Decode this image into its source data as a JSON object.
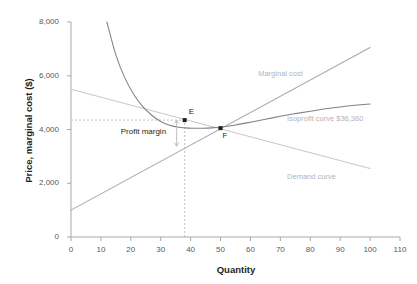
{
  "chart_data": {
    "type": "line",
    "title": "",
    "xlabel": "Quantity",
    "ylabel": "Price, marginal cost ($)",
    "xlim": [
      0,
      110
    ],
    "ylim": [
      0,
      8000
    ],
    "xticks": [
      "0",
      "10",
      "20",
      "30",
      "40",
      "50",
      "60",
      "70",
      "80",
      "90",
      "100",
      "110"
    ],
    "xtick_values": [
      0,
      10,
      20,
      30,
      40,
      50,
      60,
      70,
      80,
      90,
      100,
      110
    ],
    "yticks": [
      "0",
      "2,000",
      "4,000",
      "6,000",
      "8,000"
    ],
    "ytick_values": [
      0,
      2000,
      4000,
      6000,
      8000
    ],
    "grid": false,
    "legend_position": "inline-right",
    "series": [
      {
        "name": "Demand curve",
        "label": "Demand curve",
        "color": "#c9c9cb",
        "kind": "line",
        "x": [
          0,
          100
        ],
        "values": [
          5500,
          2550
        ],
        "label_x": 100,
        "label_y": 2250
      },
      {
        "name": "Marginal cost",
        "label": "Marginal cost",
        "color": "#a7a9ac",
        "kind": "line",
        "x": [
          0,
          100
        ],
        "values": [
          1000,
          7050
        ],
        "label_x": 88,
        "label_y": 6050
      },
      {
        "name": "Isoprofit curve $36,360",
        "label": "Isoprofit curve $36,360",
        "color": "#808285",
        "kind": "curve",
        "x": [
          12,
          15,
          18,
          21,
          24,
          27,
          30,
          33,
          36,
          38,
          41,
          44,
          47,
          50,
          55,
          60,
          65,
          70,
          75,
          80,
          85,
          90,
          95,
          100
        ],
        "values": [
          8000,
          6780,
          5920,
          5300,
          4850,
          4530,
          4300,
          4160,
          4080,
          4060,
          4050,
          4050,
          4060,
          4090,
          4170,
          4270,
          4380,
          4490,
          4590,
          4680,
          4770,
          4840,
          4900,
          4950
        ],
        "label_x": 100,
        "label_y": 4400
      }
    ],
    "points": [
      {
        "name": "E",
        "label": "E",
        "x": 38,
        "y": 4350
      },
      {
        "name": "F",
        "label": "F",
        "x": 50,
        "y": 4050
      }
    ],
    "annotations": [
      {
        "name": "profit-margin",
        "text": "Profit margin",
        "x": 26,
        "y": 3880,
        "arrow_x": 38,
        "arrow_y_top": 4350,
        "arrow_y_bottom": 3380
      }
    ],
    "guides": [
      {
        "name": "price-guide",
        "orientation": "horizontal",
        "value": 4350,
        "from": 0,
        "to": 38,
        "style": "dashed"
      },
      {
        "name": "quantity-guide",
        "orientation": "vertical",
        "value": 38,
        "from": 0,
        "to": 4350,
        "style": "dashed"
      }
    ]
  }
}
